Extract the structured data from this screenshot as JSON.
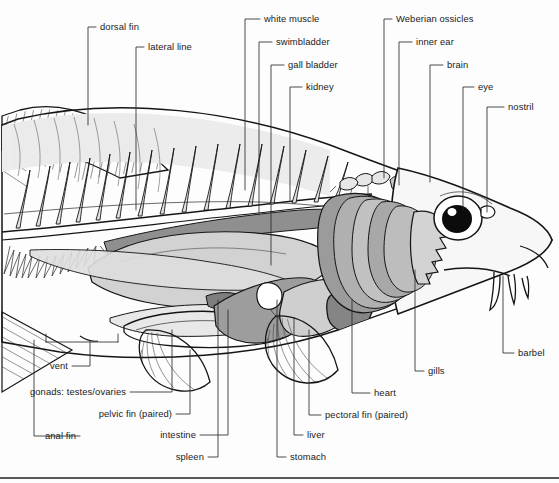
{
  "figure": {
    "background_color": "#fdfdfd",
    "line_color": "#151515",
    "label_color": "#1a1a1a",
    "bottom_rule_color": "#222222",
    "grays": {
      "muscle_light": "#d9d9d9",
      "body_pale": "#ececec",
      "organ_mid": "#bdbdbd",
      "organ_dark": "#9a9a9a",
      "organ_darkest": "#7e7e7e",
      "gill_shade": "#b5b5b5",
      "eye_pupil": "#0c0c0c"
    },
    "labels": [
      {
        "id": "dorsal-fin",
        "text": "dorsal fin",
        "text_x": 100,
        "text_y": 30,
        "anchor": "start",
        "path": "M96,27 L88,27 L88,125"
      },
      {
        "id": "lateral-line",
        "text": "lateral line",
        "text_x": 148,
        "text_y": 50,
        "anchor": "start",
        "path": "M144,47 L136,47 L136,210"
      },
      {
        "id": "white-muscle",
        "text": "white muscle",
        "text_x": 264,
        "text_y": 22,
        "anchor": "start",
        "path": "M260,19 L245,19 L245,190"
      },
      {
        "id": "swimbladder",
        "text": "swimbladder",
        "text_x": 276,
        "text_y": 45,
        "anchor": "start",
        "path": "M272,42 L259,42 L259,215"
      },
      {
        "id": "gall-bladder",
        "text": "gall bladder",
        "text_x": 288,
        "text_y": 68,
        "anchor": "start",
        "path": "M284,65 L271,65 L271,265"
      },
      {
        "id": "kidney",
        "text": "kidney",
        "text_x": 306,
        "text_y": 90,
        "anchor": "start",
        "path": "M302,87 L290,87 L290,200"
      },
      {
        "id": "weberian-ossicles",
        "text": "Weberian ossicles",
        "text_x": 396,
        "text_y": 22,
        "anchor": "start",
        "path": "M392,19 L384,19 L384,178"
      },
      {
        "id": "inner-ear",
        "text": "inner ear",
        "text_x": 416,
        "text_y": 45,
        "anchor": "start",
        "path": "M412,42 L399,42 L399,185"
      },
      {
        "id": "brain",
        "text": "brain",
        "text_x": 447,
        "text_y": 68,
        "anchor": "start",
        "path": "M443,65 L430,65 L430,182"
      },
      {
        "id": "eye",
        "text": "eye",
        "text_x": 478,
        "text_y": 90,
        "anchor": "start",
        "path": "M474,87 L463,87 L463,210"
      },
      {
        "id": "nostril",
        "text": "nostril",
        "text_x": 508,
        "text_y": 110,
        "anchor": "start",
        "path": "M504,107 L487,107 L487,212"
      },
      {
        "id": "barbel",
        "text": "barbel",
        "text_x": 518,
        "text_y": 356,
        "anchor": "start",
        "path": "M514,353 L503,353 L503,276"
      },
      {
        "id": "gills",
        "text": "gills",
        "text_x": 428,
        "text_y": 374,
        "anchor": "start",
        "path": "M424,371 L415,371 L415,270"
      },
      {
        "id": "heart",
        "text": "heart",
        "text_x": 374,
        "text_y": 396,
        "anchor": "start",
        "path": "M370,393 L352,393 L352,300"
      },
      {
        "id": "pectoral-fin",
        "text": "pectoral fin (paired)",
        "text_x": 325,
        "text_y": 418,
        "anchor": "start",
        "path": "M321,415 L309,415 L309,330"
      },
      {
        "id": "liver",
        "text": "liver",
        "text_x": 307,
        "text_y": 438,
        "anchor": "start",
        "path": "M303,435 L294,435 L294,318"
      },
      {
        "id": "stomach",
        "text": "stomach",
        "text_x": 290,
        "text_y": 460,
        "anchor": "start",
        "path": "M286,457 L277,457 L277,300"
      },
      {
        "id": "spleen",
        "text": "spleen",
        "text_x": 204,
        "text_y": 460,
        "anchor": "end",
        "path": "M208,457 L218,457 L218,300"
      },
      {
        "id": "intestine",
        "text": "intestine",
        "text_x": 196,
        "text_y": 438,
        "anchor": "end",
        "path": "M200,435 L228,435 L228,310"
      },
      {
        "id": "pelvic-fin",
        "text": "pelvic fin (paired)",
        "text_x": 172,
        "text_y": 417,
        "anchor": "end",
        "path": "M176,414 L190,414 L190,350"
      },
      {
        "id": "gonads",
        "text": "gonads: testes/ovaries",
        "text_x": 126,
        "text_y": 395,
        "anchor": "end",
        "path": "M130,392 L172,392 L172,330"
      },
      {
        "id": "vent",
        "text": "vent",
        "text_x": 68,
        "text_y": 369,
        "anchor": "end",
        "path": "M72,366 L90,366 L90,342 M46,342 L118,342 M46,342 L46,334 M118,342 L118,334"
      },
      {
        "id": "anal-fin",
        "text": "anal fin",
        "text_x": 76,
        "text_y": 439,
        "anchor": "end",
        "path": "M80,436 L34,436 L34,340"
      }
    ]
  }
}
